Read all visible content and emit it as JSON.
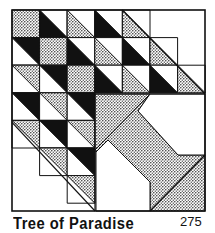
{
  "caption": {
    "title": "Tree of Paradise",
    "number": "275"
  },
  "colors": {
    "black": "#111111",
    "white": "#ffffff",
    "dot_bg": "#ffffff",
    "dot_fg": "#222222"
  },
  "grid": {
    "origin_x": 12,
    "origin_y": 10,
    "cell": 27.6,
    "rows": 7,
    "cols": 7
  },
  "cells": [
    {
      "r": 0,
      "c": 0,
      "type": "square",
      "fill": "dot"
    },
    {
      "r": 0,
      "c": 1,
      "type": "hst",
      "dir": "ll",
      "fill": "black"
    },
    {
      "r": 0,
      "c": 2,
      "type": "hst",
      "dir": "ll",
      "fill": "dot"
    },
    {
      "r": 0,
      "c": 3,
      "type": "hst",
      "dir": "ll",
      "fill": "black"
    },
    {
      "r": 0,
      "c": 4,
      "type": "hst",
      "dir": "ll",
      "fill": "dot"
    },
    {
      "r": 1,
      "c": 0,
      "type": "hst",
      "dir": "ur",
      "fill": "black"
    },
    {
      "r": 1,
      "c": 1,
      "type": "square",
      "fill": "dot"
    },
    {
      "r": 1,
      "c": 2,
      "type": "hst",
      "dir": "ll",
      "fill": "black"
    },
    {
      "r": 1,
      "c": 3,
      "type": "hst",
      "dir": "ll",
      "fill": "dot"
    },
    {
      "r": 1,
      "c": 4,
      "type": "hst",
      "dir": "ll",
      "fill": "black"
    },
    {
      "r": 1,
      "c": 5,
      "type": "hst",
      "dir": "ll",
      "fill": "dot"
    },
    {
      "r": 2,
      "c": 0,
      "type": "hst",
      "dir": "ur",
      "fill": "dot"
    },
    {
      "r": 2,
      "c": 1,
      "type": "hst",
      "dir": "ur",
      "fill": "black"
    },
    {
      "r": 2,
      "c": 2,
      "type": "square",
      "fill": "dot"
    },
    {
      "r": 2,
      "c": 3,
      "type": "hst",
      "dir": "ll",
      "fill": "black"
    },
    {
      "r": 2,
      "c": 4,
      "type": "hst",
      "dir": "ll",
      "fill": "dot"
    },
    {
      "r": 2,
      "c": 5,
      "type": "hst",
      "dir": "ll",
      "fill": "black"
    },
    {
      "r": 2,
      "c": 6,
      "type": "hst",
      "dir": "ll",
      "fill": "dot"
    },
    {
      "r": 3,
      "c": 0,
      "type": "hst",
      "dir": "ur",
      "fill": "black"
    },
    {
      "r": 3,
      "c": 1,
      "type": "hst",
      "dir": "ur",
      "fill": "dot"
    },
    {
      "r": 3,
      "c": 2,
      "type": "hst",
      "dir": "ur",
      "fill": "black"
    },
    {
      "r": 4,
      "c": 0,
      "type": "hst",
      "dir": "ur",
      "fill": "dot"
    },
    {
      "r": 4,
      "c": 1,
      "type": "hst",
      "dir": "ur",
      "fill": "black"
    },
    {
      "r": 4,
      "c": 2,
      "type": "hst",
      "dir": "ur",
      "fill": "dot"
    },
    {
      "r": 5,
      "c": 1,
      "type": "hst",
      "dir": "ur",
      "fill": "dot"
    },
    {
      "r": 5,
      "c": 2,
      "type": "hst",
      "dir": "ur",
      "fill": "black"
    },
    {
      "r": 6,
      "c": 2,
      "type": "hst",
      "dir": "ur",
      "fill": "dot"
    }
  ],
  "trunk": {
    "upper_dotted": "95,94 150,94 95,150",
    "band": "138,111 150,94 95,150 96,152 108,140 150,182 150,211 205,211 205,155 178,155",
    "white_upper_right": "150,94 205,94 205,155 178,155 138,111",
    "white_pentagon": "96,152 108,140 150,182 150,211 96,211",
    "split_line": "150,211 205,155"
  }
}
